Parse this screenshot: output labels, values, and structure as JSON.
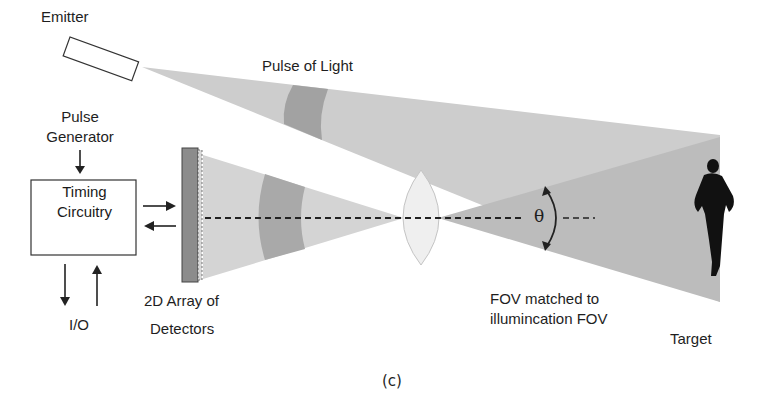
{
  "labels": {
    "emitter": "Emitter",
    "pulse_of_light": "Pulse of Light",
    "pulse_generator_line1": "Pulse",
    "pulse_generator_line2": "Generator",
    "timing_line1": "Timing",
    "timing_line2": "Circuitry",
    "io": "I/O",
    "detectors_line1": "2D Array of",
    "detectors_line2": "Detectors",
    "fov_line1": "FOV matched to",
    "fov_line2": "illumincation FOV",
    "target": "Target",
    "theta": "θ",
    "caption": "(c)"
  },
  "colors": {
    "beam_light": "#c8c8c8",
    "beam_fov": "#bdbdbd",
    "pulse_dark": "#9a9a9a",
    "detector_fill": "#8c8c8c",
    "lens_fill": "#eeeeee",
    "silhouette": "#111111"
  }
}
